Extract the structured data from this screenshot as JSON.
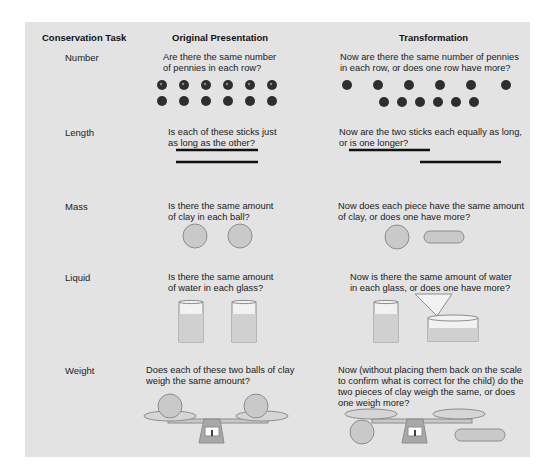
{
  "headers": {
    "task": "Conservation Task",
    "original": "Original Presentation",
    "transformation": "Transformation"
  },
  "rows": [
    {
      "task": "Number",
      "original_question": "Are there the same number\nof pennies in each row?",
      "transformation_question": "Now are there the same number of pennies\nin each row, or does one row have more?",
      "illustration": "two rows of six pennies; transformed top row spread out"
    },
    {
      "task": "Length",
      "original_question": "Is each of these sticks just\nas long as the other?",
      "transformation_question": "Now are the two sticks each equally as long,\nor is one longer?",
      "illustration": "two aligned sticks; transformed sticks offset"
    },
    {
      "task": "Mass",
      "original_question": "Is there the same amount\nof clay in each ball?",
      "transformation_question": "Now does each piece have the same amount\nof clay, or does one have more?",
      "illustration": "two clay balls; one rolled into a sausage"
    },
    {
      "task": "Liquid",
      "original_question": "Is there the same amount\nof water in each glass?",
      "transformation_question": "Now is there the same amount of water\nin each glass, or does one have more?",
      "illustration": "two equal glasses; water poured into a wide dish"
    },
    {
      "task": "Weight",
      "original_question": "Does each of these two balls of clay\nweigh the same amount?",
      "transformation_question": "Now (without placing them back on the scale\nto confirm what is correct for the child) do the\ntwo pieces of clay weigh the same, or does\none weigh more?",
      "illustration": "balance scale with two balls; ball and flattened clay"
    }
  ],
  "colors": {
    "panel_bg": "#e3e3e3",
    "object_fill": "#c9c9c9",
    "object_stroke": "#8c8c8c",
    "penny": "#2e2e2e",
    "stick": "#111111"
  }
}
